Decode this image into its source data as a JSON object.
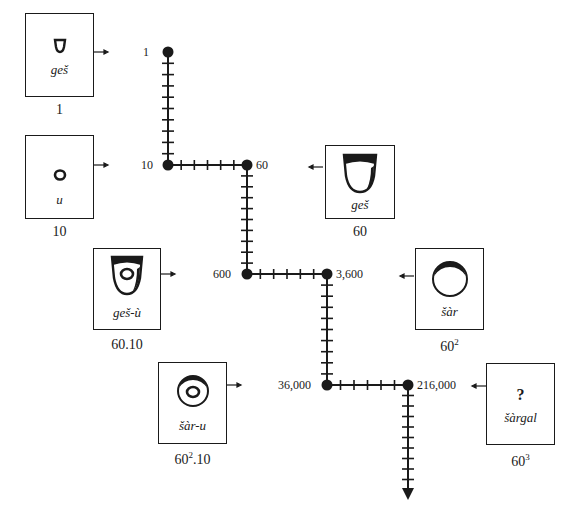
{
  "diagram": {
    "signs": [
      {
        "id": "ges-1",
        "reading": "geš",
        "value": "1",
        "value_base": "1",
        "value_exp": "",
        "value_suffix": "",
        "shape": "small-cone"
      },
      {
        "id": "u-10",
        "reading": "u",
        "value": "10",
        "value_base": "10",
        "value_exp": "",
        "value_suffix": "",
        "shape": "small-circle"
      },
      {
        "id": "ges-60",
        "reading": "geš",
        "value": "60",
        "value_base": "60",
        "value_exp": "",
        "value_suffix": "",
        "shape": "large-cone"
      },
      {
        "id": "ges-u-600",
        "reading": "geš-ù",
        "value": "60.10",
        "value_base": "60.10",
        "value_exp": "",
        "value_suffix": "",
        "shape": "large-cone-with-circle"
      },
      {
        "id": "sar-3600",
        "reading": "šàr",
        "value": "60²",
        "value_base": "60",
        "value_exp": "2",
        "value_suffix": "",
        "shape": "large-circle"
      },
      {
        "id": "sar-u-36000",
        "reading": "šàr-u",
        "value": "60².10",
        "value_base": "60",
        "value_exp": "2",
        "value_suffix": ".10",
        "shape": "large-circle-with-circle"
      },
      {
        "id": "sargal-216000",
        "reading": "šàrgal",
        "value": "60³",
        "value_base": "60",
        "value_exp": "3",
        "value_suffix": "",
        "shape": "unknown",
        "glyph": "?"
      }
    ],
    "chain_nodes": [
      {
        "label": "1",
        "x": 168,
        "y": 52
      },
      {
        "label": "10",
        "x": 168,
        "y": 165
      },
      {
        "label": "60",
        "x": 247,
        "y": 165
      },
      {
        "label": "600",
        "x": 247,
        "y": 274
      },
      {
        "label": "3,600",
        "x": 327,
        "y": 274
      },
      {
        "label": "36,000",
        "x": 327,
        "y": 385
      },
      {
        "label": "216,000",
        "x": 408,
        "y": 385
      }
    ],
    "chain_segments": [
      {
        "from": "1",
        "to": "10",
        "direction": "vertical",
        "ticks": 9
      },
      {
        "from": "10",
        "to": "60",
        "direction": "horizontal",
        "ticks": 5
      },
      {
        "from": "60",
        "to": "600",
        "direction": "vertical",
        "ticks": 9
      },
      {
        "from": "600",
        "to": "3,600",
        "direction": "horizontal",
        "ticks": 5
      },
      {
        "from": "3,600",
        "to": "36,000",
        "direction": "vertical",
        "ticks": 9
      },
      {
        "from": "36,000",
        "to": "216,000",
        "direction": "horizontal",
        "ticks": 5
      },
      {
        "from": "216,000",
        "to": "continues",
        "direction": "vertical-arrow",
        "ticks": 9
      }
    ],
    "colors": {
      "ink": "#1a1a1a",
      "background": "#ffffff"
    }
  }
}
